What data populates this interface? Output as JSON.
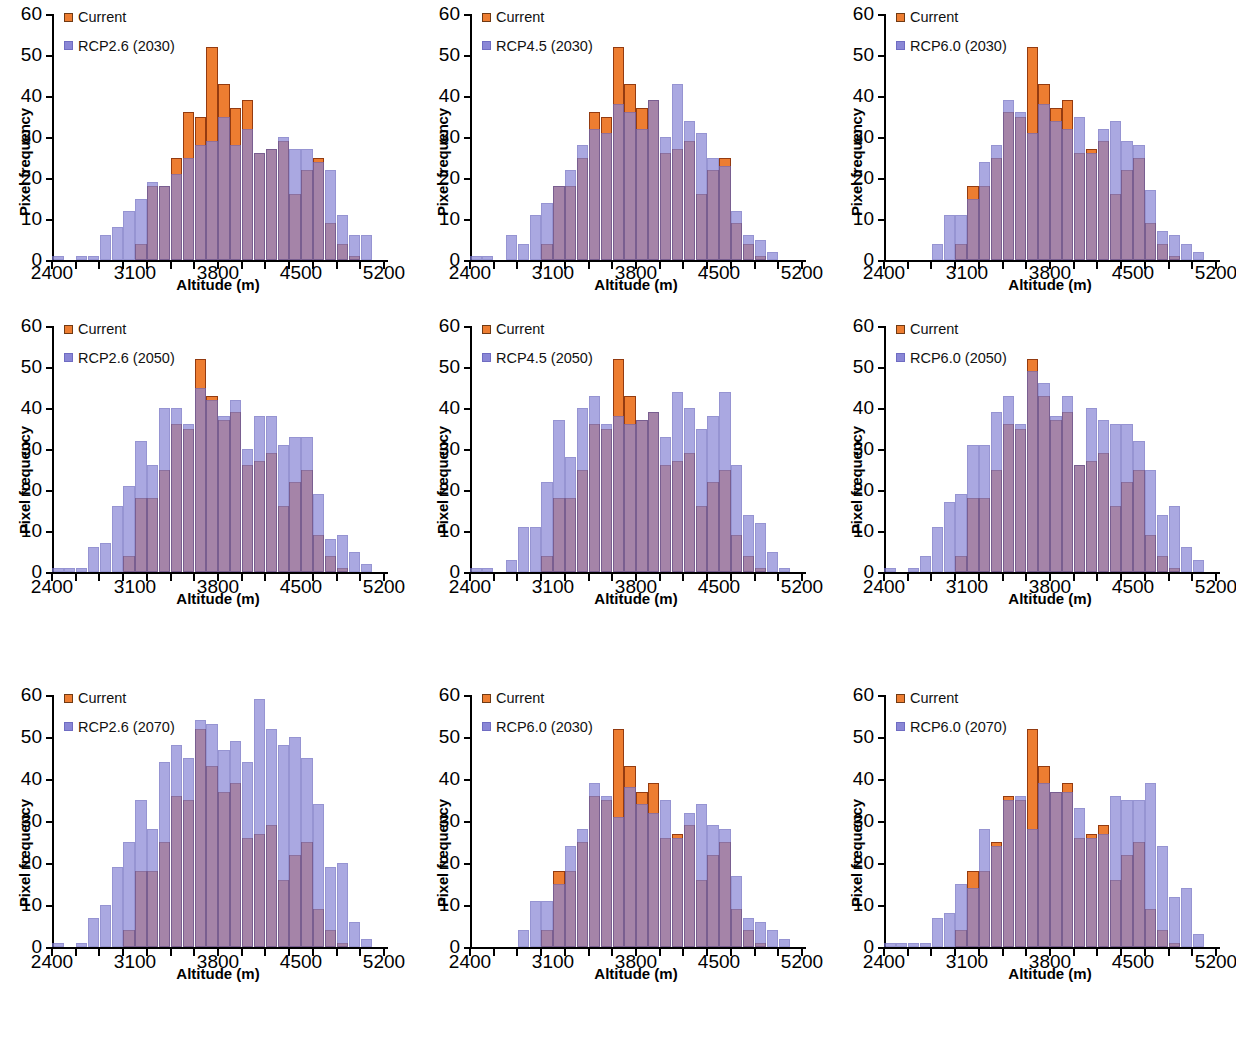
{
  "figure": {
    "type": "multi-panel-histogram",
    "panel_count": 9,
    "layout": "3 rows x 3 columns",
    "shared_xlabel": "Altitude (m)",
    "shared_ylabel": "Pixel frequency",
    "colors": {
      "current": "#ED7D31",
      "rcp": "#8A87D6",
      "overlap": "#6B3D7A",
      "axis": "#000000"
    }
  },
  "axes": {
    "x": {
      "label": "Altitude (m)",
      "min": 2400,
      "max": 5200,
      "tick_step": 200,
      "label_step": 700,
      "tick_labels": [
        "2400",
        "3100",
        "3800",
        "4500",
        "5200"
      ],
      "tick_values": [
        2400,
        3100,
        3800,
        4500,
        5200
      ]
    },
    "y": {
      "label": "Pixel frequency",
      "min": 0,
      "max": 60,
      "tick_step": 10,
      "tick_labels": [
        "0",
        "10",
        "20",
        "30",
        "40",
        "50",
        "60"
      ],
      "tick_values": [
        0,
        10,
        20,
        30,
        40,
        50,
        60
      ]
    }
  },
  "legend_common": {
    "current_label": "Current",
    "current_icon": "orange-square-swatch",
    "rcp_icon": "purple-square-swatch"
  },
  "chart_data": [
    {
      "id": "panel-1",
      "row": 1,
      "col": 1,
      "type": "bar",
      "title": "",
      "xlabel": "Altitude (m)",
      "ylabel": "Pixel frequency",
      "xlim": [
        2400,
        5200
      ],
      "ylim": [
        0,
        60
      ],
      "grid": false,
      "legend_position": "top-left",
      "legend": [
        "Current",
        "RCP2.6 (2030)"
      ],
      "x": [
        2450,
        2650,
        2750,
        2850,
        2950,
        3050,
        3150,
        3250,
        3350,
        3450,
        3550,
        3650,
        3750,
        3850,
        3950,
        4050,
        4150,
        4250,
        4350,
        4450,
        4550,
        4650,
        4750,
        4850,
        4950,
        5050
      ],
      "series": [
        {
          "name": "Current",
          "values": [
            0,
            0,
            0,
            0,
            0,
            0,
            4,
            18,
            18,
            25,
            36,
            35,
            52,
            43,
            37,
            39,
            26,
            27,
            29,
            16,
            22,
            25,
            9,
            4,
            1,
            0
          ]
        },
        {
          "name": "RCP2.6 (2030)",
          "values": [
            1,
            1,
            1,
            6,
            8,
            12,
            15,
            19,
            18,
            21,
            25,
            28,
            29,
            35,
            28,
            32,
            26,
            27,
            30,
            27,
            27,
            24,
            22,
            11,
            6,
            6
          ]
        }
      ]
    },
    {
      "id": "panel-2",
      "row": 1,
      "col": 2,
      "type": "bar",
      "title": "",
      "xlabel": "Altitude (m)",
      "ylabel": "Pixel frequency",
      "xlim": [
        2400,
        5200
      ],
      "ylim": [
        0,
        60
      ],
      "grid": false,
      "legend_position": "top-left",
      "legend": [
        "Current",
        "RCP4.5 (2030)"
      ],
      "x": [
        2450,
        2550,
        2650,
        2750,
        2850,
        2950,
        3050,
        3150,
        3250,
        3350,
        3450,
        3550,
        3650,
        3750,
        3850,
        3950,
        4050,
        4150,
        4250,
        4350,
        4450,
        4550,
        4650,
        4750,
        4850,
        4950,
        5050
      ],
      "series": [
        {
          "name": "Current",
          "values": [
            0,
            0,
            0,
            0,
            0,
            0,
            4,
            18,
            18,
            25,
            36,
            35,
            52,
            43,
            37,
            39,
            26,
            27,
            29,
            16,
            22,
            25,
            9,
            4,
            1,
            0,
            0
          ]
        },
        {
          "name": "RCP4.5 (2030)",
          "values": [
            1,
            1,
            0,
            6,
            4,
            11,
            14,
            18,
            22,
            28,
            32,
            31,
            38,
            36,
            32,
            39,
            30,
            43,
            34,
            31,
            25,
            23,
            12,
            6,
            5,
            2,
            0
          ]
        }
      ]
    },
    {
      "id": "panel-3",
      "row": 1,
      "col": 3,
      "type": "bar",
      "title": "",
      "xlabel": "Altitude (m)",
      "ylabel": "Pixel frequency",
      "xlim": [
        2400,
        5200
      ],
      "ylim": [
        0,
        60
      ],
      "grid": false,
      "legend_position": "top-left",
      "legend": [
        "Current",
        "RCP6.0 (2030)"
      ],
      "x": [
        2850,
        2950,
        3050,
        3150,
        3250,
        3350,
        3450,
        3550,
        3650,
        3750,
        3850,
        3950,
        4050,
        4150,
        4250,
        4350,
        4450,
        4550,
        4650,
        4750,
        4850,
        4950,
        5050
      ],
      "series": [
        {
          "name": "Current",
          "values": [
            0,
            0,
            4,
            18,
            18,
            25,
            36,
            35,
            52,
            43,
            37,
            39,
            26,
            27,
            29,
            16,
            22,
            25,
            9,
            4,
            1,
            0,
            0
          ]
        },
        {
          "name": "RCP6.0 (2030)",
          "values": [
            4,
            11,
            11,
            15,
            24,
            28,
            39,
            36,
            31,
            38,
            34,
            32,
            35,
            26,
            32,
            34,
            29,
            28,
            17,
            7,
            6,
            4,
            2
          ]
        }
      ]
    },
    {
      "id": "panel-4",
      "row": 2,
      "col": 1,
      "type": "bar",
      "title": "",
      "xlabel": "Altitude (m)",
      "ylabel": "Pixel frequency",
      "xlim": [
        2400,
        5200
      ],
      "ylim": [
        0,
        60
      ],
      "grid": false,
      "legend_position": "top-left",
      "legend": [
        "Current",
        "RCP2.6 (2050)"
      ],
      "x": [
        2450,
        2550,
        2650,
        2750,
        2850,
        2950,
        3050,
        3150,
        3250,
        3350,
        3450,
        3550,
        3650,
        3750,
        3850,
        3950,
        4050,
        4150,
        4250,
        4350,
        4450,
        4550,
        4650,
        4750,
        4850,
        4950,
        5050
      ],
      "series": [
        {
          "name": "Current",
          "values": [
            0,
            0,
            0,
            0,
            0,
            0,
            4,
            18,
            18,
            25,
            36,
            35,
            52,
            43,
            37,
            39,
            26,
            27,
            29,
            16,
            22,
            25,
            9,
            4,
            1,
            0,
            0
          ]
        },
        {
          "name": "RCP2.6 (2050)",
          "values": [
            1,
            1,
            1,
            6,
            7,
            16,
            21,
            32,
            26,
            40,
            40,
            36,
            45,
            42,
            38,
            42,
            30,
            38,
            38,
            31,
            33,
            33,
            19,
            8,
            9,
            5,
            2
          ]
        }
      ]
    },
    {
      "id": "panel-5",
      "row": 2,
      "col": 2,
      "type": "bar",
      "title": "",
      "xlabel": "Altitude (m)",
      "ylabel": "Pixel frequency",
      "xlim": [
        2400,
        5200
      ],
      "ylim": [
        0,
        60
      ],
      "grid": false,
      "legend_position": "top-left",
      "legend": [
        "Current",
        "RCP4.5 (2050)"
      ],
      "x": [
        2450,
        2550,
        2650,
        2750,
        2850,
        2950,
        3050,
        3150,
        3250,
        3350,
        3450,
        3550,
        3650,
        3750,
        3850,
        3950,
        4050,
        4150,
        4250,
        4350,
        4450,
        4550,
        4650,
        4750,
        4850,
        4950,
        5050
      ],
      "series": [
        {
          "name": "Current",
          "values": [
            0,
            0,
            0,
            0,
            0,
            0,
            4,
            18,
            18,
            25,
            36,
            35,
            52,
            43,
            37,
            39,
            26,
            27,
            29,
            16,
            22,
            25,
            9,
            4,
            1,
            0,
            0
          ]
        },
        {
          "name": "RCP4.5 (2050)",
          "values": [
            1,
            1,
            0,
            3,
            11,
            11,
            22,
            37,
            28,
            40,
            43,
            36,
            38,
            36,
            37,
            39,
            33,
            44,
            40,
            35,
            38,
            44,
            26,
            14,
            12,
            5,
            1
          ]
        }
      ]
    },
    {
      "id": "panel-6",
      "row": 2,
      "col": 3,
      "type": "bar",
      "title": "",
      "xlabel": "Altitude (m)",
      "ylabel": "Pixel frequency",
      "xlim": [
        2400,
        5200
      ],
      "ylim": [
        0,
        60
      ],
      "grid": false,
      "legend_position": "top-left",
      "legend": [
        "Current",
        "RCP6.0 (2050)"
      ],
      "x": [
        2450,
        2650,
        2750,
        2850,
        2950,
        3050,
        3150,
        3250,
        3350,
        3450,
        3550,
        3650,
        3750,
        3850,
        3950,
        4050,
        4150,
        4250,
        4350,
        4450,
        4550,
        4650,
        4750,
        4850,
        4950,
        5050
      ],
      "series": [
        {
          "name": "Current",
          "values": [
            0,
            0,
            0,
            0,
            0,
            4,
            18,
            18,
            25,
            36,
            35,
            52,
            43,
            37,
            39,
            26,
            27,
            29,
            16,
            22,
            25,
            9,
            4,
            1,
            0,
            0
          ]
        },
        {
          "name": "RCP6.0 (2050)",
          "values": [
            1,
            1,
            4,
            11,
            17,
            19,
            31,
            31,
            39,
            43,
            36,
            49,
            46,
            38,
            43,
            26,
            40,
            37,
            36,
            36,
            32,
            25,
            14,
            16,
            6,
            3
          ]
        }
      ]
    },
    {
      "id": "panel-7",
      "row": 3,
      "col": 1,
      "type": "bar",
      "title": "",
      "xlabel": "Altitude (m)",
      "ylabel": "Pixel frequency",
      "xlim": [
        2400,
        5200
      ],
      "ylim": [
        0,
        60
      ],
      "grid": false,
      "legend_position": "top-left",
      "legend": [
        "Current",
        "RCP2.6 (2070)"
      ],
      "x": [
        2450,
        2650,
        2750,
        2850,
        2950,
        3050,
        3150,
        3250,
        3350,
        3450,
        3550,
        3650,
        3750,
        3850,
        3950,
        4050,
        4150,
        4250,
        4350,
        4450,
        4550,
        4650,
        4750,
        4850,
        4950,
        5050
      ],
      "series": [
        {
          "name": "Current",
          "values": [
            0,
            0,
            0,
            0,
            0,
            4,
            18,
            18,
            25,
            36,
            35,
            52,
            43,
            37,
            39,
            26,
            27,
            29,
            16,
            22,
            25,
            9,
            4,
            1,
            0,
            0
          ]
        },
        {
          "name": "RCP2.6 (2070)",
          "values": [
            1,
            1,
            7,
            10,
            19,
            25,
            35,
            28,
            44,
            48,
            45,
            54,
            53,
            47,
            49,
            44,
            59,
            52,
            48,
            50,
            45,
            34,
            19,
            20,
            6,
            2
          ]
        }
      ]
    },
    {
      "id": "panel-8",
      "row": 3,
      "col": 2,
      "type": "bar",
      "title": "",
      "xlabel": "Altitude (m)",
      "ylabel": "Pixel frequency",
      "xlim": [
        2400,
        5200
      ],
      "ylim": [
        0,
        60
      ],
      "grid": false,
      "legend_position": "top-left",
      "legend": [
        "Current",
        "RCP6.0 (2030)"
      ],
      "x": [
        2850,
        2950,
        3050,
        3150,
        3250,
        3350,
        3450,
        3550,
        3650,
        3750,
        3850,
        3950,
        4050,
        4150,
        4250,
        4350,
        4450,
        4550,
        4650,
        4750,
        4850,
        4950,
        5050
      ],
      "series": [
        {
          "name": "Current",
          "values": [
            0,
            0,
            4,
            18,
            18,
            25,
            36,
            35,
            52,
            43,
            37,
            39,
            26,
            27,
            29,
            16,
            22,
            25,
            9,
            4,
            1,
            0,
            0
          ]
        },
        {
          "name": "RCP6.0 (2030)",
          "values": [
            4,
            11,
            11,
            15,
            24,
            28,
            39,
            36,
            31,
            38,
            34,
            32,
            35,
            26,
            32,
            34,
            29,
            28,
            17,
            7,
            6,
            4,
            2
          ]
        }
      ]
    },
    {
      "id": "panel-9",
      "row": 3,
      "col": 3,
      "type": "bar",
      "title": "",
      "xlabel": "Altitude (m)",
      "ylabel": "Pixel frequency",
      "xlim": [
        2400,
        5200
      ],
      "ylim": [
        0,
        60
      ],
      "grid": false,
      "legend_position": "top-left",
      "legend": [
        "Current",
        "RCP6.0 (2070)"
      ],
      "x": [
        2450,
        2550,
        2650,
        2750,
        2850,
        2950,
        3050,
        3150,
        3250,
        3350,
        3450,
        3550,
        3650,
        3750,
        3850,
        3950,
        4050,
        4150,
        4250,
        4350,
        4450,
        4550,
        4650,
        4750,
        4850,
        4950,
        5050
      ],
      "series": [
        {
          "name": "Current",
          "values": [
            0,
            0,
            0,
            0,
            0,
            0,
            4,
            18,
            18,
            25,
            36,
            35,
            52,
            43,
            37,
            39,
            26,
            27,
            29,
            16,
            22,
            25,
            9,
            4,
            1,
            0,
            0
          ]
        },
        {
          "name": "RCP6.0 (2070)",
          "values": [
            1,
            1,
            1,
            1,
            7,
            8,
            15,
            14,
            28,
            24,
            35,
            36,
            28,
            39,
            37,
            37,
            33,
            26,
            27,
            36,
            35,
            35,
            39,
            24,
            12,
            14,
            3
          ]
        }
      ]
    }
  ]
}
